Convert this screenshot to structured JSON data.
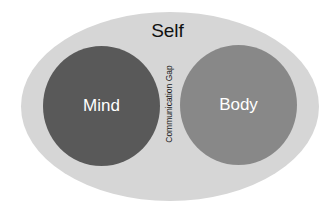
{
  "diagram": {
    "outer": {
      "label": "Self",
      "color": "#d6d6d6"
    },
    "circles": [
      {
        "label": "Mind",
        "color": "#595959"
      },
      {
        "label": "Body",
        "color": "#888888"
      }
    ],
    "gap_label": "Communication Gap"
  }
}
